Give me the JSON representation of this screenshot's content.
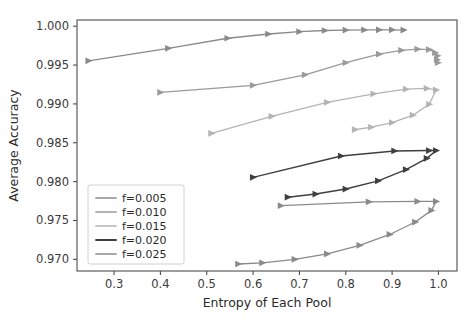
{
  "chart_data": {
    "type": "line",
    "title": "",
    "xlabel": "Entropy of Each Pool",
    "ylabel": "Average Accuracy",
    "xlim": [
      0.22,
      1.04
    ],
    "ylim": [
      0.9685,
      1.0008
    ],
    "xticks": [
      "0.3",
      "0.4",
      "0.5",
      "0.6",
      "0.7",
      "0.8",
      "0.9",
      "1.0"
    ],
    "xtick_values": [
      0.3,
      0.4,
      0.5,
      0.6,
      0.7,
      0.8,
      0.9,
      1.0
    ],
    "yticks": [
      "0.970",
      "0.975",
      "0.980",
      "0.985",
      "0.990",
      "0.995",
      "1.000"
    ],
    "ytick_values": [
      0.97,
      0.975,
      0.98,
      0.985,
      0.99,
      0.995,
      1.0
    ],
    "grid": false,
    "legend_position": "lower left",
    "marker": "triangle-right",
    "series": [
      {
        "name": "f=0.005",
        "color": "#8a8a8a",
        "width": 1.3,
        "points": [
          [
            0.245,
            0.99555
          ],
          [
            0.417,
            0.99715
          ],
          [
            0.545,
            0.99845
          ],
          [
            0.633,
            0.999
          ],
          [
            0.7,
            0.9993
          ],
          [
            0.755,
            0.99945
          ],
          [
            0.8,
            0.9995
          ],
          [
            0.84,
            0.99952
          ],
          [
            0.872,
            0.99953
          ],
          [
            0.9,
            0.99953
          ],
          [
            0.925,
            0.9995
          ]
        ]
      },
      {
        "name": "f=0.010",
        "color": "#9a9a9a",
        "width": 1.3,
        "points": [
          [
            0.4,
            0.99148
          ],
          [
            0.6,
            0.9924
          ],
          [
            0.712,
            0.99375
          ],
          [
            0.8,
            0.9953
          ],
          [
            0.872,
            0.9964
          ],
          [
            0.92,
            0.9969
          ],
          [
            0.955,
            0.99705
          ],
          [
            0.98,
            0.997
          ],
          [
            0.993,
            0.9966
          ],
          [
            0.998,
            0.9962
          ],
          [
            0.997,
            0.9957
          ],
          [
            0.999,
            0.9953
          ]
        ]
      },
      {
        "name": "f=0.015",
        "color": "#b4b4b4",
        "width": 1.3,
        "points": [
          [
            0.51,
            0.9862
          ],
          [
            0.64,
            0.9884
          ],
          [
            0.76,
            0.9902
          ],
          [
            0.86,
            0.9913
          ],
          [
            0.93,
            0.9919
          ],
          [
            0.975,
            0.992
          ],
          [
            0.995,
            0.9918
          ],
          [
            0.98,
            0.98995
          ],
          [
            0.945,
            0.98855
          ],
          [
            0.9,
            0.9876
          ],
          [
            0.855,
            0.987
          ],
          [
            0.82,
            0.9867
          ]
        ]
      },
      {
        "name": "f=0.020",
        "color": "#3f3f3f",
        "width": 1.5,
        "points": [
          [
            0.6,
            0.98055
          ],
          [
            0.79,
            0.9833
          ],
          [
            0.905,
            0.98395
          ],
          [
            0.98,
            0.984
          ],
          [
            0.995,
            0.984
          ],
          [
            0.975,
            0.983
          ],
          [
            0.93,
            0.98155
          ],
          [
            0.87,
            0.9801
          ],
          [
            0.8,
            0.97905
          ],
          [
            0.735,
            0.9784
          ],
          [
            0.675,
            0.978
          ]
        ]
      },
      {
        "name": "f=0.025",
        "color": "#8a8a8a",
        "width": 1.3,
        "points": [
          [
            0.66,
            0.9769
          ],
          [
            0.85,
            0.9774
          ],
          [
            0.955,
            0.97745
          ],
          [
            0.995,
            0.97745
          ],
          [
            0.985,
            0.9763
          ],
          [
            0.95,
            0.9748
          ],
          [
            0.895,
            0.9732
          ],
          [
            0.83,
            0.9718
          ],
          [
            0.76,
            0.9707
          ],
          [
            0.69,
            0.97
          ],
          [
            0.62,
            0.96955
          ],
          [
            0.568,
            0.9694
          ]
        ]
      }
    ]
  },
  "legend": {
    "entries": [
      {
        "label": "f=0.005"
      },
      {
        "label": "f=0.010"
      },
      {
        "label": "f=0.015"
      },
      {
        "label": "f=0.020"
      },
      {
        "label": "f=0.025"
      }
    ]
  }
}
